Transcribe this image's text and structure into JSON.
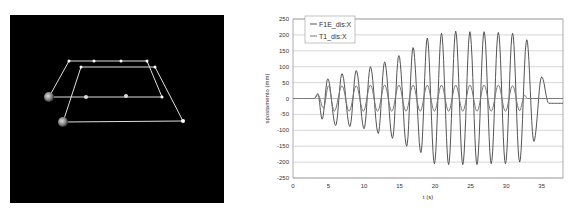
{
  "model_view": {
    "background": "#000000",
    "line_color": "#e8e8e8"
  },
  "chart_data": {
    "type": "line",
    "title": "",
    "xlabel": "t (s)",
    "ylabel": "spostamento (mm)",
    "xlim": [
      0,
      38
    ],
    "ylim": [
      -250,
      250
    ],
    "xticks": [
      "0",
      "5",
      "10",
      "15",
      "20",
      "25",
      "30",
      "35"
    ],
    "yticks": [
      "250",
      "200",
      "150",
      "100",
      "50",
      "0",
      "-50",
      "-100",
      "-150",
      "-200",
      "-250"
    ],
    "grid": true,
    "legend_position": "top-left",
    "series": [
      {
        "name": "F1E_dis:X",
        "color": "#555555",
        "peaks": [
          {
            "t": 3.0,
            "v": 0
          },
          {
            "t": 3.5,
            "v": 15
          },
          {
            "t": 4.1,
            "v": -65
          },
          {
            "t": 4.9,
            "v": 62
          },
          {
            "t": 6.0,
            "v": -85
          },
          {
            "t": 6.9,
            "v": 78
          },
          {
            "t": 8.0,
            "v": -88
          },
          {
            "t": 8.9,
            "v": 88
          },
          {
            "t": 10.0,
            "v": -95
          },
          {
            "t": 10.9,
            "v": 100
          },
          {
            "t": 12.0,
            "v": -110
          },
          {
            "t": 12.9,
            "v": 115
          },
          {
            "t": 14.0,
            "v": -125
          },
          {
            "t": 14.9,
            "v": 135
          },
          {
            "t": 16.0,
            "v": -150
          },
          {
            "t": 16.9,
            "v": 160
          },
          {
            "t": 18.0,
            "v": -170
          },
          {
            "t": 18.9,
            "v": 190
          },
          {
            "t": 19.9,
            "v": -205
          },
          {
            "t": 20.9,
            "v": 205
          },
          {
            "t": 21.9,
            "v": -208
          },
          {
            "t": 22.9,
            "v": 212
          },
          {
            "t": 23.9,
            "v": -208
          },
          {
            "t": 24.9,
            "v": 210
          },
          {
            "t": 25.9,
            "v": -208
          },
          {
            "t": 26.9,
            "v": 210
          },
          {
            "t": 27.9,
            "v": -205
          },
          {
            "t": 28.9,
            "v": 208
          },
          {
            "t": 29.9,
            "v": -205
          },
          {
            "t": 30.9,
            "v": 205
          },
          {
            "t": 31.9,
            "v": -200
          },
          {
            "t": 32.9,
            "v": 185
          },
          {
            "t": 33.9,
            "v": -135
          },
          {
            "t": 35.0,
            "v": 68
          },
          {
            "t": 36.0,
            "v": -15
          },
          {
            "t": 38.0,
            "v": -15
          }
        ]
      },
      {
        "name": "T1_dis:X",
        "color": "#777777",
        "peaks": [
          {
            "t": 0,
            "v": 0
          },
          {
            "t": 3.0,
            "v": 0
          },
          {
            "t": 3.5,
            "v": 12
          },
          {
            "t": 4.3,
            "v": -30
          },
          {
            "t": 5.0,
            "v": 40
          },
          {
            "t": 5.8,
            "v": -40
          },
          {
            "t": 6.9,
            "v": 40
          },
          {
            "t": 7.9,
            "v": -40
          },
          {
            "t": 8.9,
            "v": 40
          },
          {
            "t": 9.9,
            "v": -40
          },
          {
            "t": 10.9,
            "v": 42
          },
          {
            "t": 11.9,
            "v": -40
          },
          {
            "t": 12.9,
            "v": 42
          },
          {
            "t": 13.9,
            "v": -40
          },
          {
            "t": 14.9,
            "v": 42
          },
          {
            "t": 15.9,
            "v": -40
          },
          {
            "t": 16.9,
            "v": 42
          },
          {
            "t": 17.9,
            "v": -40
          },
          {
            "t": 18.9,
            "v": 42
          },
          {
            "t": 19.9,
            "v": -40
          },
          {
            "t": 20.9,
            "v": 42
          },
          {
            "t": 21.9,
            "v": -40
          },
          {
            "t": 22.9,
            "v": 42
          },
          {
            "t": 23.9,
            "v": -40
          },
          {
            "t": 24.9,
            "v": 42
          },
          {
            "t": 25.9,
            "v": -40
          },
          {
            "t": 26.9,
            "v": 42
          },
          {
            "t": 27.9,
            "v": -40
          },
          {
            "t": 28.9,
            "v": 42
          },
          {
            "t": 29.9,
            "v": -40
          },
          {
            "t": 30.9,
            "v": 40
          },
          {
            "t": 31.9,
            "v": -38
          },
          {
            "t": 32.6,
            "v": 10
          },
          {
            "t": 33.0,
            "v": 0
          },
          {
            "t": 38.0,
            "v": 0
          }
        ]
      }
    ]
  }
}
